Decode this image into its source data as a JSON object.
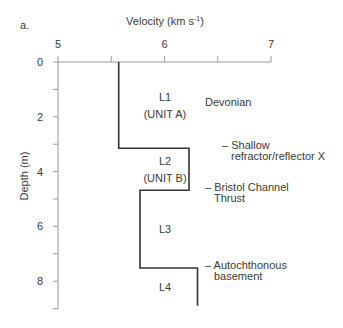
{
  "panel_label": "a.",
  "chart_data": {
    "type": "line",
    "subtype": "step-profile",
    "title": "",
    "xlabel": "Velocity (km s-1)",
    "xlabel_main": "Velocity (km s",
    "xlabel_sup": "-1",
    "xlabel_close": ")",
    "ylabel": "Depth (m)",
    "xlim": [
      5,
      7
    ],
    "ylim": [
      0,
      9
    ],
    "y_inverted": true,
    "x_axis_position": "top",
    "x_ticks": [
      5,
      5.5,
      6,
      6.5,
      7
    ],
    "x_tick_labels": [
      "5",
      "",
      "6",
      "",
      "7"
    ],
    "y_ticks": [
      0,
      1,
      2,
      3,
      4,
      5,
      6,
      7,
      8,
      9
    ],
    "y_tick_labels": [
      "0",
      "",
      "2",
      "",
      "4",
      "",
      "6",
      "",
      "8",
      ""
    ],
    "grid": false,
    "legend": null,
    "series": [
      {
        "name": "Velocity-depth profile",
        "layers": [
          {
            "name": "L1",
            "unit": "(UNIT A)",
            "velocity": 5.57,
            "top": 0.0,
            "bottom": 3.15
          },
          {
            "name": "L2",
            "unit": "(UNIT B)",
            "velocity": 6.23,
            "top": 3.15,
            "bottom": 4.68
          },
          {
            "name": "L3",
            "unit": "",
            "velocity": 5.77,
            "top": 4.68,
            "bottom": 7.52
          },
          {
            "name": "L4",
            "unit": "",
            "velocity": 6.31,
            "top": 7.52,
            "bottom": 8.9
          }
        ]
      }
    ],
    "annotations": [
      {
        "text": "Devonian",
        "depth": 1.45
      },
      {
        "text": "– Shallow refractor/reflector X",
        "line1": "– Shallow",
        "line2": "refractor/reflector X",
        "depth": 3.15
      },
      {
        "text": "– Bristol Channel Thrust",
        "line1": "– Bristol Channel",
        "line2": "Thrust",
        "depth": 4.68
      },
      {
        "text": "– Autochthonous basement",
        "line1": "– Autochthonous",
        "line2": "basement",
        "depth": 7.52
      }
    ]
  }
}
